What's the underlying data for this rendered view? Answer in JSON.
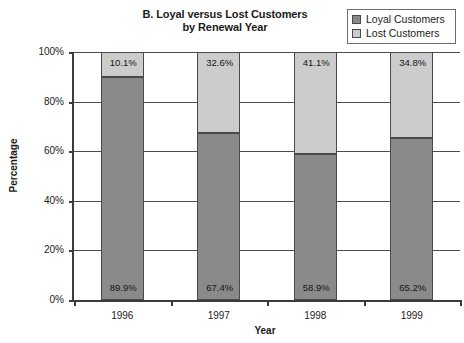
{
  "chart_data": {
    "type": "bar",
    "subtype": "stacked-100-percent",
    "title": "B. Loyal versus Lost Customers by Renewal Year",
    "title_line1": "B. Loyal versus Lost Customers",
    "title_line2": "by Renewal Year",
    "xlabel": "Year",
    "ylabel": "Percentage",
    "categories": [
      "1996",
      "1997",
      "1998",
      "1999"
    ],
    "ylim": [
      0,
      100
    ],
    "yticks": [
      0,
      20,
      40,
      60,
      80,
      100
    ],
    "ytick_labels": [
      "0%",
      "20%",
      "40%",
      "60%",
      "80%",
      "100%"
    ],
    "grid": true,
    "legend_position": "top-right",
    "series": [
      {
        "name": "Loyal Customers",
        "color": "#8a8a8a",
        "values": [
          89.9,
          67.4,
          58.9,
          65.2
        ],
        "labels": [
          "89.9%",
          "67.4%",
          "58.9%",
          "65.2%"
        ]
      },
      {
        "name": "Lost Customers",
        "color": "#cccccc",
        "values": [
          10.1,
          32.6,
          41.1,
          34.8
        ],
        "labels": [
          "10.1%",
          "32.6%",
          "41.1%",
          "34.8%"
        ]
      }
    ]
  },
  "legend": {
    "items": [
      {
        "label": "Loyal Customers",
        "swatch": "#8a8a8a"
      },
      {
        "label": "Lost Customers",
        "swatch": "#cccccc"
      }
    ]
  }
}
